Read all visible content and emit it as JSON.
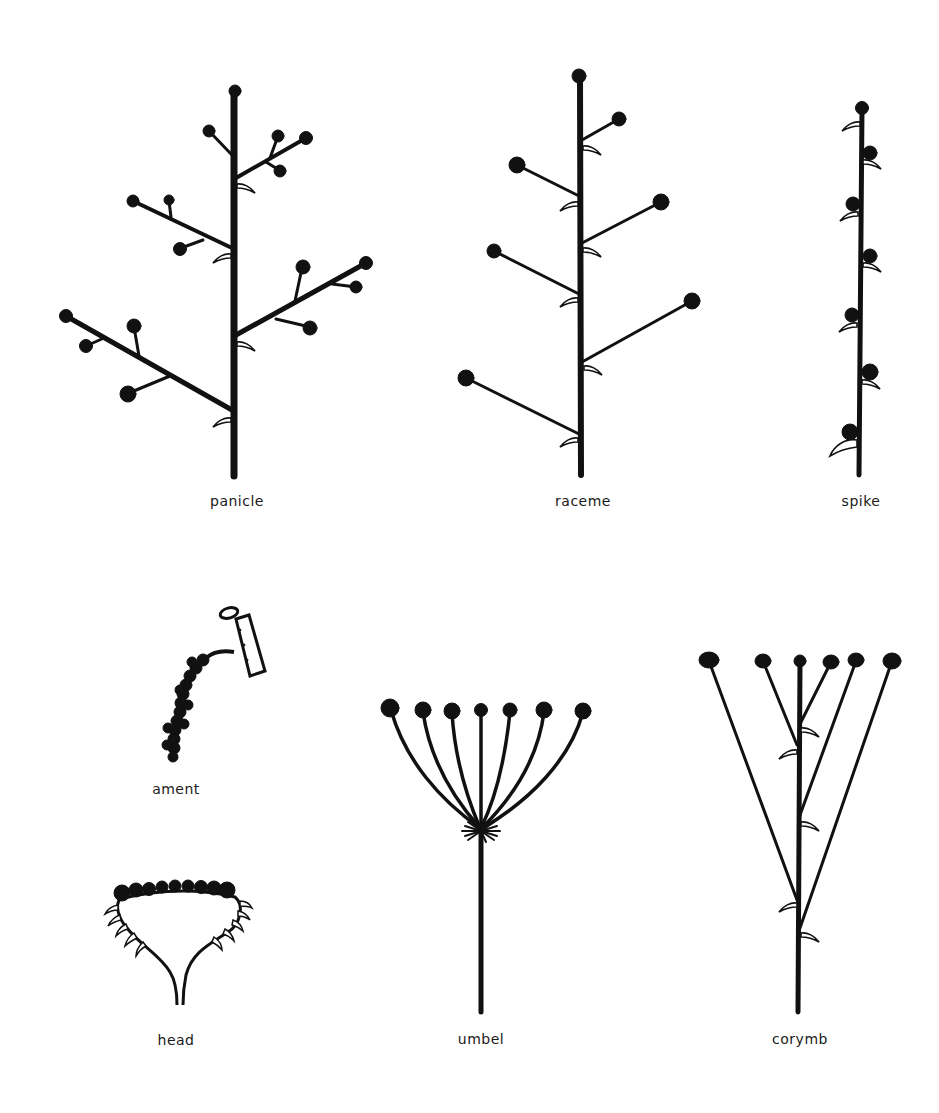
{
  "diagram": {
    "ink_color": "#111111",
    "background": "#ffffff",
    "figures": [
      {
        "id": "panicle",
        "label": "panicle",
        "label_pos": [
          237,
          502
        ]
      },
      {
        "id": "raceme",
        "label": "raceme",
        "label_pos": [
          583,
          502
        ]
      },
      {
        "id": "spike",
        "label": "spike",
        "label_pos": [
          861,
          502
        ]
      },
      {
        "id": "ament",
        "label": "ament",
        "label_pos": [
          176,
          790
        ]
      },
      {
        "id": "head",
        "label": "head",
        "label_pos": [
          176,
          1041
        ]
      },
      {
        "id": "umbel",
        "label": "umbel",
        "label_pos": [
          481,
          1041
        ]
      },
      {
        "id": "corymb",
        "label": "corymb",
        "label_pos": [
          800,
          1041
        ]
      }
    ]
  }
}
